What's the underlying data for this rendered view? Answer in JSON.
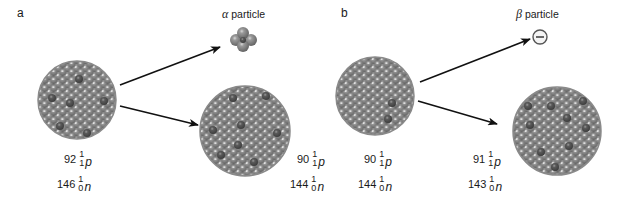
{
  "panels": [
    {
      "letter": "a",
      "particle_label_symbol": "α",
      "particle_label_text": " particle",
      "parent": {
        "protons": {
          "count": "92",
          "mass": "1",
          "charge": "1",
          "symbol": "p"
        },
        "neutrons": {
          "count": "146",
          "mass": "1",
          "charge": "0",
          "symbol": "n"
        }
      },
      "daughter": {
        "protons": {
          "count": "90",
          "mass": "1",
          "charge": "1",
          "symbol": "p"
        },
        "neutrons": {
          "count": "144",
          "mass": "1",
          "charge": "0",
          "symbol": "n"
        }
      }
    },
    {
      "letter": "b",
      "particle_label_symbol": "β",
      "particle_label_text": " particle",
      "particle_glyph": "−",
      "parent": {
        "protons": {
          "count": "90",
          "mass": "1",
          "charge": "1",
          "symbol": "p"
        },
        "neutrons": {
          "count": "144",
          "mass": "1",
          "charge": "0",
          "symbol": "n"
        }
      },
      "daughter": {
        "protons": {
          "count": "91",
          "mass": "1",
          "charge": "1",
          "symbol": "p"
        },
        "neutrons": {
          "count": "143",
          "mass": "1",
          "charge": "0",
          "symbol": "n"
        }
      }
    }
  ],
  "colors": {
    "nucleon_base": "#7a7a7a",
    "nucleon_dark": "#4a4a4a",
    "nucleon_light": "#a8a8a8",
    "arrow": "#111111"
  }
}
